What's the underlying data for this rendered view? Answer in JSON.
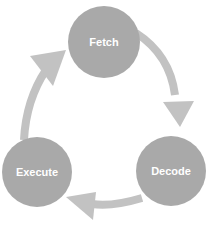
{
  "diagram": {
    "type": "cycle",
    "nodes": [
      {
        "id": "fetch",
        "label": "Fetch"
      },
      {
        "id": "decode",
        "label": "Decode"
      },
      {
        "id": "execute",
        "label": "Execute"
      }
    ],
    "edges": [
      {
        "from": "fetch",
        "to": "decode"
      },
      {
        "from": "decode",
        "to": "execute"
      },
      {
        "from": "execute",
        "to": "fetch"
      }
    ],
    "colors": {
      "node_fill": "#a9a9a9",
      "arrow_fill": "#c2c2c2",
      "label_color": "#ffffff",
      "background": "#ffffff"
    }
  }
}
